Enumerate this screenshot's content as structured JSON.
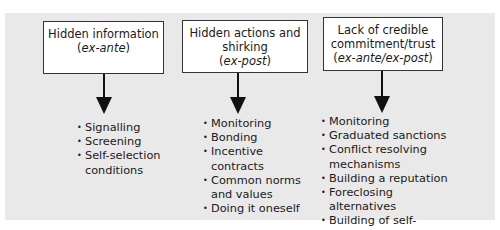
{
  "diagram": {
    "columns": [
      {
        "title_lines": [
          "Hidden information"
        ],
        "qualifier": "ex-ante",
        "items": [
          "Signalling",
          "Screening",
          "Self-selection conditions"
        ]
      },
      {
        "title_lines": [
          "Hidden actions and",
          "shirking"
        ],
        "qualifier": "ex-post",
        "items": [
          "Monitoring",
          "Bonding",
          "Incentive contracts",
          "Common norms and values",
          "Doing it oneself"
        ]
      },
      {
        "title_lines": [
          "Lack of credible",
          "commitment/trust"
        ],
        "qualifier": "ex-ante/ex-post",
        "items": [
          "Monitoring",
          "Graduated sanctions",
          "Conflict resolving mechanisms",
          "Building a reputation",
          "Foreclosing alternatives",
          "Building of self-interest"
        ]
      }
    ],
    "colors": {
      "panel": "#e9e9e9",
      "box": "#ffffff",
      "stroke": "#111111"
    }
  }
}
